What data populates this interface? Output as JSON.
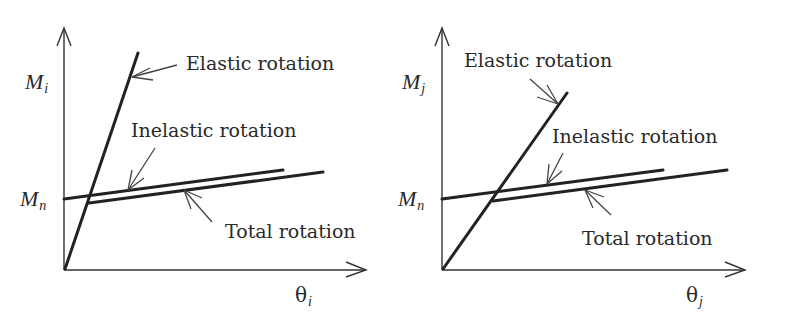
{
  "diagram": {
    "left_panel": {
      "y_axis_label": "M",
      "y_axis_subscript": "i",
      "x_axis_label": "θ",
      "x_axis_subscript": "i",
      "mn_label": "M",
      "mn_subscript": "n",
      "elastic_label": "Elastic rotation",
      "inelastic_label": "Inelastic rotation",
      "total_label": "Total rotation"
    },
    "right_panel": {
      "y_axis_label": "M",
      "y_axis_subscript": "j",
      "x_axis_label": "θ",
      "x_axis_subscript": "j",
      "mn_label": "M",
      "mn_subscript": "n",
      "elastic_label": "Elastic rotation",
      "inelastic_label": "Inelastic rotation",
      "total_label": "Total rotation"
    }
  }
}
